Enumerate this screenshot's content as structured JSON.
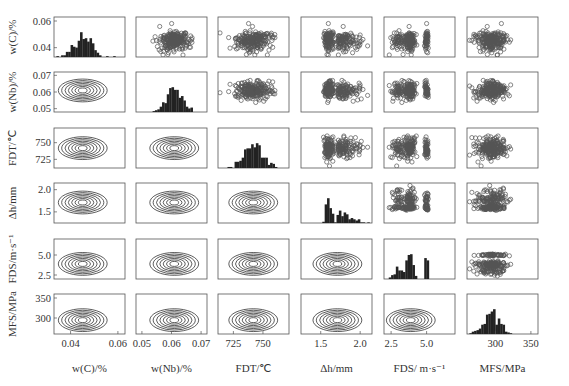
{
  "chart_data": {
    "type": "scatter",
    "subtype": "pair-plot-matrix",
    "title": "",
    "layout": {
      "rows": 6,
      "cols": 6,
      "diagonal": "histogram",
      "upper_triangle": "scatter (open circles)",
      "lower_triangle": "density contour",
      "grid": false
    },
    "variables": [
      {
        "id": "C",
        "label": "w(C)/%",
        "ylabel": "w(C)/%",
        "range": [
          0.033,
          0.063
        ],
        "ticks": [
          0.04,
          0.06
        ],
        "tick_labels": [
          "0.04",
          "0.06"
        ]
      },
      {
        "id": "Nb",
        "label": "w(Nb)/%",
        "ylabel": "w(Nb)/%",
        "range": [
          0.048,
          0.072
        ],
        "ticks": [
          0.05,
          0.06,
          0.07
        ],
        "tick_labels": [
          "0.05",
          "0.06",
          "0.07"
        ]
      },
      {
        "id": "FDT",
        "label": "FDT/℃",
        "ylabel": "FDT/℃",
        "range": [
          712,
          772
        ],
        "ticks": [
          725,
          750
        ],
        "tick_labels": [
          "725",
          "750"
        ]
      },
      {
        "id": "dh",
        "label": "Δh/mm",
        "ylabel": "Δh/mm",
        "range": [
          1.25,
          2.15
        ],
        "ticks": [
          1.5,
          2.0
        ],
        "tick_labels": [
          "1.5",
          "2.0"
        ]
      },
      {
        "id": "FDS",
        "label": "FDS/ m·s⁻¹",
        "ylabel": "FDS/m·s⁻¹",
        "range": [
          2.0,
          7.0
        ],
        "ticks": [
          2.5,
          5.0
        ],
        "tick_labels": [
          "2.5",
          "5.0"
        ]
      },
      {
        "id": "MFS",
        "label": "MFS/MPa",
        "ylabel": "MFS/MPa",
        "range": [
          260,
          360
        ],
        "ticks": [
          300,
          350
        ],
        "tick_labels": [
          "300",
          "350"
        ]
      }
    ],
    "row_tick_labels": [
      [
        "0.04",
        "0.06"
      ],
      [
        "0.05",
        "0.06",
        "0.07"
      ],
      [
        "725",
        "750"
      ],
      [
        "1.5",
        "2.0"
      ],
      [
        "2.5",
        "5.0"
      ],
      [
        "300",
        "350"
      ]
    ],
    "x_tick_labels": [
      [
        "0.04",
        "0.06"
      ],
      [
        "0.05",
        "0.06",
        "0.07"
      ],
      [
        "725",
        "750"
      ],
      [
        "1.5",
        "2.0"
      ],
      [
        "2.5",
        "5.0"
      ],
      [
        "300",
        "350"
      ]
    ],
    "distributions": {
      "C": {
        "center": 0.045,
        "spread": 0.004,
        "shape": "right-skewed, mode ~0.045"
      },
      "Nb": {
        "center": 0.061,
        "spread": 0.0025,
        "shape": "approx normal, mode ~0.061"
      },
      "FDT": {
        "center": 742,
        "spread": 8,
        "shape": "approx normal, mode ~745"
      },
      "dh": {
        "center": 1.62,
        "spread": 0.12,
        "shape": "sharp peak ~1.6, right tail to 2.0"
      },
      "FDS": {
        "center": 3.9,
        "spread": 0.6,
        "shape": "multi-modal spikes at ~3.8 and ~5.0"
      },
      "MFS": {
        "center": 295,
        "spread": 12,
        "shape": "approx normal, mode ~295"
      }
    }
  },
  "axis_labels": {
    "x": [
      "w(C)/%",
      "w(Nb)/%",
      "FDT/℃",
      "Δh/mm",
      "FDS/ m·s⁻¹",
      "MFS/MPa"
    ],
    "y": [
      "w(C)/%",
      "w(Nb)/%",
      "FDT/℃",
      "Δh/mm",
      "FDS/m·s⁻¹",
      "MFS/MPa"
    ]
  }
}
